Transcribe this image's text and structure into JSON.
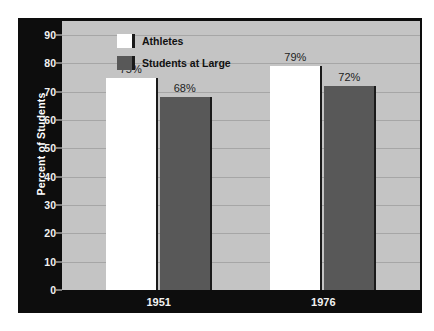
{
  "chart_data": {
    "type": "bar",
    "title": "",
    "xlabel": "",
    "ylabel": "Percent of Students",
    "ylim": [
      0,
      95
    ],
    "yticks": [
      0,
      10,
      20,
      30,
      40,
      50,
      60,
      70,
      80,
      90
    ],
    "ytick_labels": [
      "0",
      "10",
      "20",
      "30",
      "40",
      "50",
      "60",
      "70",
      "80",
      "90"
    ],
    "grid": true,
    "legend_position": "top-left",
    "categories": [
      "1951",
      "1976"
    ],
    "series": [
      {
        "name": "Athletes",
        "color": "#ffffff",
        "values": [
          75,
          79
        ],
        "value_labels": [
          "75%",
          "68%"
        ]
      },
      {
        "name": "Students at Large",
        "color": "#585858",
        "values": [
          68,
          72
        ],
        "value_labels": [
          "79%",
          "72%"
        ]
      }
    ],
    "bars": [
      {
        "group": "1951",
        "series": "Athletes",
        "value": 75,
        "label": "75%"
      },
      {
        "group": "1951",
        "series": "Students at Large",
        "value": 68,
        "label": "68%"
      },
      {
        "group": "1976",
        "series": "Athletes",
        "value": 79,
        "label": "79%"
      },
      {
        "group": "1976",
        "series": "Students at Large",
        "value": 72,
        "label": "72%"
      }
    ],
    "colors": {
      "panel_background": "#0d0d0d",
      "plot_background": "#c4c4c4",
      "gridline": "#a6a6a6",
      "athletes_bar": "#ffffff",
      "students_bar": "#585858",
      "axis_text": "#f2f2f2",
      "value_text": "#1d1d1d"
    }
  },
  "legend": {
    "items": [
      {
        "label": "Athletes"
      },
      {
        "label": "Students at Large"
      }
    ]
  }
}
